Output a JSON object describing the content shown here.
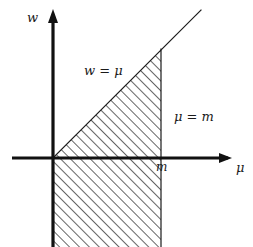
{
  "figure": {
    "name": "region-diagram",
    "background_color": "#ffffff",
    "ink_color": "#1a1a1a",
    "width": 253,
    "height": 247
  },
  "axes": {
    "vertical": {
      "label": "w",
      "name": "w-axis",
      "arrow": "up"
    },
    "horizontal": {
      "label": "μ",
      "name": "mu-axis",
      "arrow": "right"
    },
    "origin": {
      "x": 53,
      "y": 158
    }
  },
  "ticks": [
    {
      "label": "m",
      "axis": "horizontal",
      "position_px": 161
    }
  ],
  "lines": [
    {
      "name": "line-w-equals-mu",
      "label": "w = μ",
      "kind": "diagonal",
      "slope": 1
    },
    {
      "name": "line-mu-equals-m",
      "label": "μ = m",
      "kind": "vertical",
      "at": "m"
    }
  ],
  "region": {
    "name": "hatched-region",
    "fill": "diagonal-hatch",
    "hatch_angle_deg": 45,
    "hatch_spacing_px": 7,
    "description": "0 ≤ μ ≤ m, w ≤ μ"
  }
}
